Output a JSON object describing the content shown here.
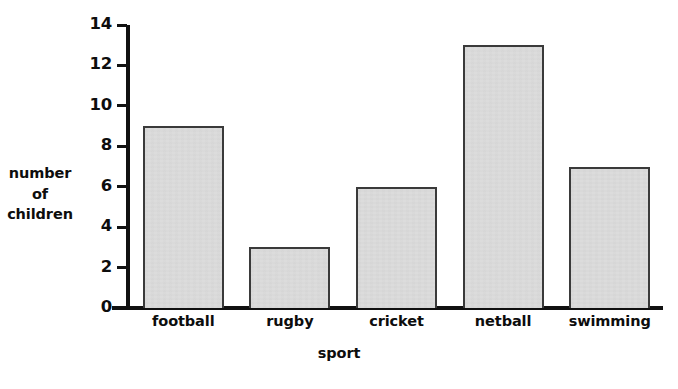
{
  "chart_data": {
    "type": "bar",
    "title": "",
    "categories": [
      "football",
      "rugby",
      "cricket",
      "netball",
      "swimming"
    ],
    "values": [
      9,
      3,
      6,
      13,
      7
    ],
    "series": [
      {
        "name": "number of children",
        "values": [
          9,
          3,
          6,
          13,
          7
        ]
      }
    ],
    "xlabel": "sport",
    "ylabel": "number of children",
    "ylabel_lines": [
      "number",
      "of",
      "children"
    ],
    "ylim": [
      0,
      14
    ],
    "ytick_step": 2,
    "yticks": [
      0,
      2,
      4,
      6,
      8,
      10,
      12,
      14
    ],
    "ytick_labels": [
      "0",
      "2",
      "4",
      "6",
      "8",
      "10",
      "12",
      "14"
    ],
    "grid": false,
    "legend": false,
    "legend_position": "none",
    "bar_fill_color": "#dcdcdc",
    "bar_border_color": "#3a3a3a",
    "axis_color": "#111111",
    "background_color": "#ffffff",
    "text_color": "#0d0d0d"
  }
}
